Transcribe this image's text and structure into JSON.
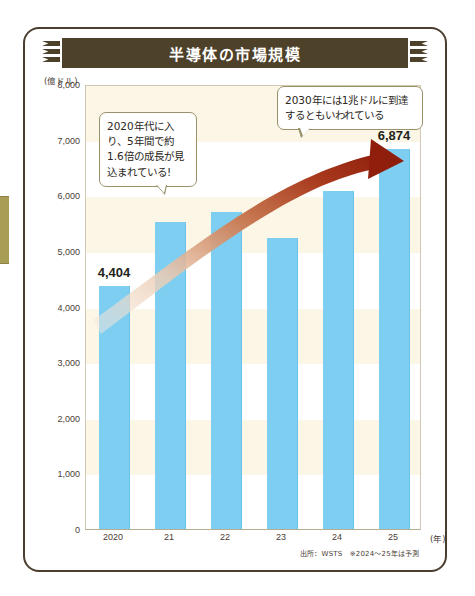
{
  "page": {
    "title": "半導体の市場規模"
  },
  "chart_data": {
    "type": "bar",
    "title": "半導体の市場規模",
    "categories": [
      "2020",
      "21",
      "22",
      "23",
      "24",
      "25"
    ],
    "values": [
      4404,
      5559,
      5741,
      5268,
      6111,
      6874
    ],
    "value_labels": [
      "4,404",
      "",
      "",
      "",
      "",
      "6,874"
    ],
    "xlabel": "(年)",
    "ylabel": "(億ドル)",
    "ylim": [
      0,
      8000
    ],
    "ytick_step": 1000,
    "yticks": [
      "8,000",
      "7,000",
      "6,000",
      "5,000",
      "4,000",
      "3,000",
      "2,000",
      "1,000",
      "0"
    ],
    "grid": false,
    "legend": "none",
    "bar_color": "#7ecef2",
    "band_color": "#fbf6e6",
    "annotations": [
      {
        "name": "growth-note",
        "text": "2020年代に入り、5年間で約1.6倍の成長が見込まれている!"
      },
      {
        "name": "forecast-note",
        "text": "2030年には1兆ドルに到達するともいわれている"
      }
    ],
    "trend_arrow": {
      "name": "growth-arrow",
      "color_start": "#f3e2d4",
      "color_end": "#9c2a14",
      "direction": "up-right"
    },
    "source": "出所：WSTS　※2024〜25年は予測"
  },
  "theme": {
    "banner_bg": "#4e4129",
    "banner_text": "#ffffff",
    "frame_border": "#4a3f2e",
    "tab_color": "#a99c55"
  }
}
